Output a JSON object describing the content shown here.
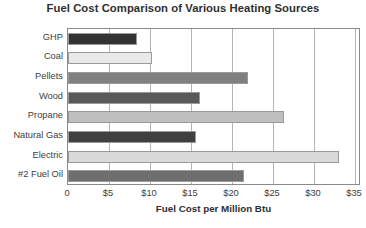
{
  "chart_data": {
    "type": "bar",
    "orientation": "horizontal",
    "title": "Fuel Cost Comparison of Various Heating Sources",
    "xlabel": "Fuel Cost per Million Btu",
    "ylabel": "",
    "categories": [
      "GHP",
      "Coal",
      "Pellets",
      "Wood",
      "Propane",
      "Natural Gas",
      "Electric",
      "#2 Fuel Oil"
    ],
    "values": [
      8.4,
      10.2,
      22.0,
      16.1,
      26.3,
      15.6,
      33.0,
      21.5
    ],
    "bar_colors": [
      "#333333",
      "#e9e9e9",
      "#808080",
      "#595959",
      "#bfbfbf",
      "#404040",
      "#dadada",
      "#6e6e6e"
    ],
    "xlim": [
      0,
      35
    ],
    "xticks": [
      0,
      5,
      10,
      15,
      20,
      25,
      30,
      35
    ],
    "xtick_labels": [
      "0",
      "$5",
      "$10",
      "$15",
      "$20",
      "$25",
      "$30",
      "$35"
    ],
    "grid": "vertical",
    "legend": null,
    "series": [
      {
        "name": "Fuel Cost per Million Btu",
        "points": [
          {
            "category": "GHP",
            "value": 8.4
          },
          {
            "category": "Coal",
            "value": 10.2
          },
          {
            "category": "Pellets",
            "value": 22.0
          },
          {
            "category": "Wood",
            "value": 16.1
          },
          {
            "category": "Propane",
            "value": 26.3
          },
          {
            "category": "Natural Gas",
            "value": 15.6
          },
          {
            "category": "Electric",
            "value": 33.0
          },
          {
            "category": "#2 Fuel Oil",
            "value": 21.5
          }
        ]
      }
    ]
  }
}
